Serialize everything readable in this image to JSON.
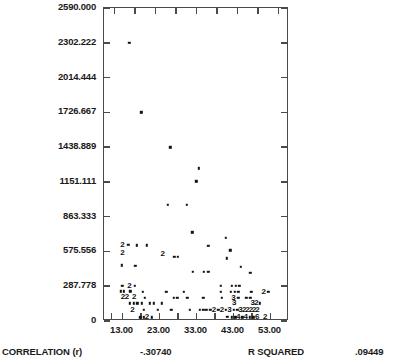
{
  "chart_data": {
    "type": "scatter",
    "title": "",
    "xlabel": "",
    "ylabel": "",
    "xlim": [
      8.0,
      58.0
    ],
    "ylim": [
      0,
      2590.0
    ],
    "grid": false,
    "legend": null,
    "yticks": [
      "2590.000",
      "2302.222",
      "2014.444",
      "1726.667",
      "1438.889",
      "1151.111",
      "863.333",
      "575.556",
      "287.778",
      "0"
    ],
    "ytick_values": [
      2590.0,
      2302.222,
      2014.444,
      1726.667,
      1438.889,
      1151.111,
      863.333,
      575.556,
      287.778,
      0
    ],
    "xticks": [
      "13.00",
      "23.00",
      "33.00",
      "43.00",
      "53.00"
    ],
    "xtick_values": [
      13.0,
      23.0,
      33.0,
      43.0,
      53.0
    ],
    "top_axis_tick_count": 9,
    "marker_note": "single points drawn as dots; digits 2/3/4 mark number of coincident observations",
    "points": [
      {
        "x": 14.8,
        "y": 2302.2,
        "n": 1
      },
      {
        "x": 18.1,
        "y": 1726.7,
        "n": 1
      },
      {
        "x": 25.9,
        "y": 1438.9,
        "n": 1
      },
      {
        "x": 33.6,
        "y": 1265.0,
        "n": 1
      },
      {
        "x": 32.9,
        "y": 1155.0,
        "n": 1
      },
      {
        "x": 25.2,
        "y": 960.0,
        "n": 1
      },
      {
        "x": 30.3,
        "y": 960.0,
        "n": 1
      },
      {
        "x": 31.9,
        "y": 735.0,
        "n": 1
      },
      {
        "x": 40.9,
        "y": 690.0,
        "n": 1
      },
      {
        "x": 13.0,
        "y": 630.0,
        "n": 2
      },
      {
        "x": 14.6,
        "y": 630.0,
        "n": 1
      },
      {
        "x": 16.8,
        "y": 625.0,
        "n": 1
      },
      {
        "x": 19.5,
        "y": 625.0,
        "n": 1
      },
      {
        "x": 36.2,
        "y": 620.0,
        "n": 1
      },
      {
        "x": 42.1,
        "y": 585.0,
        "n": 1
      },
      {
        "x": 13.0,
        "y": 565.0,
        "n": 2
      },
      {
        "x": 23.9,
        "y": 555.0,
        "n": 2
      },
      {
        "x": 27.0,
        "y": 530.0,
        "n": 1
      },
      {
        "x": 28.0,
        "y": 530.0,
        "n": 1
      },
      {
        "x": 41.2,
        "y": 520.0,
        "n": 1
      },
      {
        "x": 12.8,
        "y": 460.0,
        "n": 1
      },
      {
        "x": 16.5,
        "y": 455.0,
        "n": 1
      },
      {
        "x": 45.0,
        "y": 450.0,
        "n": 1
      },
      {
        "x": 32.0,
        "y": 405.0,
        "n": 1
      },
      {
        "x": 35.0,
        "y": 405.0,
        "n": 1
      },
      {
        "x": 36.2,
        "y": 405.0,
        "n": 1
      },
      {
        "x": 47.5,
        "y": 400.0,
        "n": 1
      },
      {
        "x": 12.9,
        "y": 290.0,
        "n": 1
      },
      {
        "x": 14.9,
        "y": 290.0,
        "n": 2
      },
      {
        "x": 16.3,
        "y": 290.0,
        "n": 1
      },
      {
        "x": 39.6,
        "y": 290.0,
        "n": 1
      },
      {
        "x": 42.5,
        "y": 292.0,
        "n": 1
      },
      {
        "x": 43.6,
        "y": 292.0,
        "n": 1
      },
      {
        "x": 44.6,
        "y": 292.0,
        "n": 1
      },
      {
        "x": 12.5,
        "y": 245.0,
        "n": 1
      },
      {
        "x": 13.4,
        "y": 245.0,
        "n": 1
      },
      {
        "x": 15.1,
        "y": 245.0,
        "n": 1
      },
      {
        "x": 18.5,
        "y": 240.0,
        "n": 1
      },
      {
        "x": 24.8,
        "y": 240.0,
        "n": 1
      },
      {
        "x": 29.6,
        "y": 240.0,
        "n": 1
      },
      {
        "x": 39.6,
        "y": 243.0,
        "n": 1
      },
      {
        "x": 42.3,
        "y": 243.0,
        "n": 1
      },
      {
        "x": 43.3,
        "y": 243.0,
        "n": 1
      },
      {
        "x": 44.3,
        "y": 243.0,
        "n": 1
      },
      {
        "x": 47.8,
        "y": 240.0,
        "n": 1
      },
      {
        "x": 51.2,
        "y": 240.0,
        "n": 2
      },
      {
        "x": 52.4,
        "y": 240.0,
        "n": 1
      },
      {
        "x": 13.1,
        "y": 195.0,
        "n": 2
      },
      {
        "x": 14.2,
        "y": 195.0,
        "n": 2
      },
      {
        "x": 16.2,
        "y": 195.0,
        "n": 2
      },
      {
        "x": 19.0,
        "y": 192.0,
        "n": 1
      },
      {
        "x": 26.8,
        "y": 190.0,
        "n": 1
      },
      {
        "x": 27.8,
        "y": 190.0,
        "n": 1
      },
      {
        "x": 30.5,
        "y": 190.0,
        "n": 1
      },
      {
        "x": 34.8,
        "y": 190.0,
        "n": 1
      },
      {
        "x": 39.8,
        "y": 190.0,
        "n": 1
      },
      {
        "x": 43.0,
        "y": 190.0,
        "n": 3
      },
      {
        "x": 44.3,
        "y": 190.0,
        "n": 1
      },
      {
        "x": 46.5,
        "y": 190.0,
        "n": 1
      },
      {
        "x": 47.5,
        "y": 190.0,
        "n": 1
      },
      {
        "x": 15.0,
        "y": 145.0,
        "n": 1
      },
      {
        "x": 16.0,
        "y": 145.0,
        "n": 1
      },
      {
        "x": 17.0,
        "y": 145.0,
        "n": 1
      },
      {
        "x": 18.2,
        "y": 145.0,
        "n": 1
      },
      {
        "x": 20.4,
        "y": 145.0,
        "n": 1
      },
      {
        "x": 21.4,
        "y": 145.0,
        "n": 1
      },
      {
        "x": 23.6,
        "y": 145.0,
        "n": 1
      },
      {
        "x": 43.2,
        "y": 145.0,
        "n": 3
      },
      {
        "x": 48.2,
        "y": 145.0,
        "n": 3
      },
      {
        "x": 49.2,
        "y": 145.0,
        "n": 2
      },
      {
        "x": 50.1,
        "y": 145.0,
        "n": 1
      },
      {
        "x": 15.7,
        "y": 95.0,
        "n": 2
      },
      {
        "x": 18.8,
        "y": 95.0,
        "n": 1
      },
      {
        "x": 22.6,
        "y": 95.0,
        "n": 1
      },
      {
        "x": 26.2,
        "y": 95.0,
        "n": 1
      },
      {
        "x": 31.2,
        "y": 95.0,
        "n": 1
      },
      {
        "x": 33.9,
        "y": 95.0,
        "n": 1
      },
      {
        "x": 34.8,
        "y": 95.0,
        "n": 1
      },
      {
        "x": 35.7,
        "y": 95.0,
        "n": 1
      },
      {
        "x": 36.7,
        "y": 95.0,
        "n": 1
      },
      {
        "x": 37.7,
        "y": 95.0,
        "n": 2
      },
      {
        "x": 38.9,
        "y": 95.0,
        "n": 1
      },
      {
        "x": 39.9,
        "y": 95.0,
        "n": 2
      },
      {
        "x": 41.0,
        "y": 95.0,
        "n": 1
      },
      {
        "x": 41.9,
        "y": 95.0,
        "n": 3
      },
      {
        "x": 43.0,
        "y": 95.0,
        "n": 1
      },
      {
        "x": 44.0,
        "y": 95.0,
        "n": 1
      },
      {
        "x": 44.9,
        "y": 95.0,
        "n": 3
      },
      {
        "x": 45.9,
        "y": 95.0,
        "n": 2
      },
      {
        "x": 46.8,
        "y": 95.0,
        "n": 2
      },
      {
        "x": 47.7,
        "y": 95.0,
        "n": 2
      },
      {
        "x": 48.6,
        "y": 95.0,
        "n": 2
      },
      {
        "x": 49.5,
        "y": 95.0,
        "n": 2
      },
      {
        "x": 17.8,
        "y": 32.0,
        "n": 1
      },
      {
        "x": 18.8,
        "y": 32.0,
        "n": 1
      },
      {
        "x": 19.6,
        "y": 30.0,
        "n": 2
      },
      {
        "x": 20.9,
        "y": 32.0,
        "n": 1
      },
      {
        "x": 41.3,
        "y": 35.0,
        "n": 1
      },
      {
        "x": 42.6,
        "y": 32.0,
        "n": 1
      },
      {
        "x": 43.5,
        "y": 32.0,
        "n": 1
      },
      {
        "x": 44.3,
        "y": 30.0,
        "n": 4
      },
      {
        "x": 45.4,
        "y": 32.0,
        "n": 1
      },
      {
        "x": 46.3,
        "y": 30.0,
        "n": 4
      },
      {
        "x": 47.4,
        "y": 32.0,
        "n": 1
      },
      {
        "x": 48.3,
        "y": 32.0,
        "n": 1
      },
      {
        "x": 49.4,
        "y": 30.0,
        "n": 6
      },
      {
        "x": 51.6,
        "y": 30.0,
        "n": 2
      }
    ]
  },
  "footer": {
    "correlation_label": "CORRELATION (r)",
    "correlation_value": "-.30740",
    "r_squared_label": "R SQUARED",
    "r_squared_value": ".09449"
  }
}
